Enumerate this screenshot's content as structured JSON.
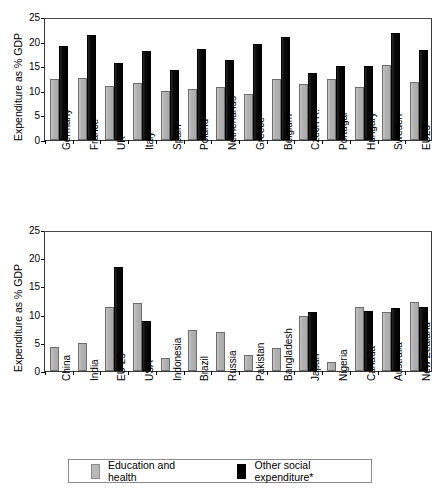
{
  "legend": {
    "entries": [
      {
        "label": "Education and health",
        "color": "#b5b5b5",
        "key": "education_and_health"
      },
      {
        "label": "Other social expenditure*",
        "color": "#0d0d0d",
        "key": "other_social_expenditure"
      }
    ]
  },
  "chart_data": [
    {
      "id": "european-countries",
      "type": "bar",
      "title": "",
      "xlabel": "",
      "ylabel": "Expenditure as % GDP",
      "ylim": [
        0,
        25
      ],
      "yticks": [
        0,
        5,
        10,
        15,
        20,
        25
      ],
      "grid": false,
      "legend_position": "bottom",
      "categories": [
        "Germany",
        "France",
        "UK",
        "Italy",
        "Spain",
        "Poland",
        "Netherlands",
        "Greece",
        "Belgium",
        "Czech R.",
        "Portugal",
        "Hungary",
        "Sweden",
        "EU25"
      ],
      "series": [
        {
          "name": "Education and health",
          "color": "#b5b5b5",
          "values": [
            12.5,
            12.7,
            10.9,
            11.6,
            9.9,
            10.3,
            10.7,
            9.3,
            12.4,
            11.3,
            12.4,
            10.8,
            15.2,
            11.8
          ]
        },
        {
          "name": "Other social expenditure*",
          "color": "#0d0d0d",
          "values": [
            19.2,
            21.4,
            15.6,
            18.1,
            14.2,
            18.6,
            16.3,
            19.5,
            21.0,
            13.6,
            15.1,
            15.1,
            21.8,
            18.2
          ]
        }
      ]
    },
    {
      "id": "world-countries",
      "type": "bar",
      "title": "",
      "xlabel": "",
      "ylabel": "Expenditure as % GDP",
      "ylim": [
        0,
        25
      ],
      "yticks": [
        0,
        5,
        10,
        15,
        20,
        25
      ],
      "grid": false,
      "legend_position": "bottom",
      "categories": [
        "China",
        "India",
        "EU 25",
        "USA",
        "Indonesia",
        "Brazil",
        "Russia",
        "Pakistan",
        "Bangladesh",
        "Japan",
        "Nigeria",
        "Canada",
        "Australia",
        "New Zealand"
      ],
      "series": [
        {
          "name": "Education and health",
          "color": "#b5b5b5",
          "values": [
            4.2,
            5.0,
            11.3,
            12.1,
            2.3,
            7.3,
            6.9,
            2.8,
            4.0,
            9.7,
            1.6,
            11.3,
            10.5,
            12.2
          ]
        },
        {
          "name": "Other social expenditure*",
          "color": "#0d0d0d",
          "values": [
            0,
            0,
            18.4,
            8.9,
            0,
            0,
            0,
            0,
            0,
            10.5,
            0,
            10.6,
            11.1,
            11.4
          ]
        }
      ]
    }
  ]
}
